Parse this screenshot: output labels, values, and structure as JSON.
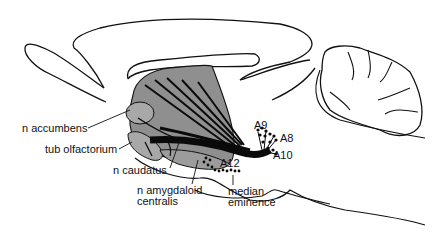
{
  "figure": {
    "colors": {
      "outline": "#111111",
      "striatum_fill": "#8f8f8f",
      "tract": "#0a0a0a",
      "background": "#ffffff"
    }
  },
  "labels": {
    "n_accumbens": "n accumbens",
    "tub_olfactorium": "tub olfactorium",
    "n_caudatus": "n caudatus",
    "n_amygdaloid_line1": "n amygdaloid",
    "n_amygdaloid_line2": "centralis",
    "median_line1": "median",
    "median_line2": "eminence",
    "a9": "A9",
    "a8": "A8",
    "a10": "A10",
    "a12": "A12"
  }
}
